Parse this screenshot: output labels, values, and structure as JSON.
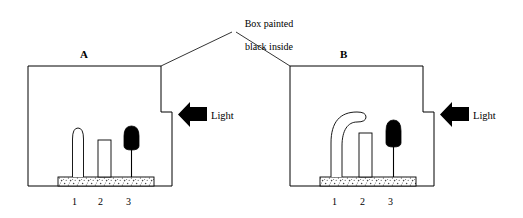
{
  "diagram": {
    "type": "phototropism-experiment",
    "caption": {
      "line1": "Box painted",
      "line2": "black inside"
    },
    "panels": [
      {
        "id": "A",
        "letter": "A",
        "light_label": "Light",
        "light_direction": "from-right",
        "specimen_numbers": [
          "1",
          "2",
          "3"
        ],
        "specimens": [
          {
            "number": "1",
            "name": "intact-coleoptile",
            "tip": "rounded",
            "bent": false
          },
          {
            "number": "2",
            "name": "decapitated-coleoptile",
            "tip": "flat-cut",
            "bent": false
          },
          {
            "number": "3",
            "name": "black-capped-coleoptile",
            "tip": "opaque-cap",
            "bent": false
          }
        ]
      },
      {
        "id": "B",
        "letter": "B",
        "light_label": "Light",
        "light_direction": "from-right",
        "specimen_numbers": [
          "1",
          "2",
          "3"
        ],
        "specimens": [
          {
            "number": "1",
            "name": "intact-coleoptile",
            "tip": "rounded",
            "bent": true
          },
          {
            "number": "2",
            "name": "decapitated-coleoptile",
            "tip": "flat-cut",
            "bent": false
          },
          {
            "number": "3",
            "name": "black-capped-coleoptile",
            "tip": "opaque-cap",
            "bent": false
          }
        ]
      }
    ],
    "colors": {
      "stroke": "#000000",
      "cap_fill": "#000000",
      "box_fill": "#ffffff",
      "soil_fill": "#ffffff",
      "background": "#ffffff"
    }
  }
}
